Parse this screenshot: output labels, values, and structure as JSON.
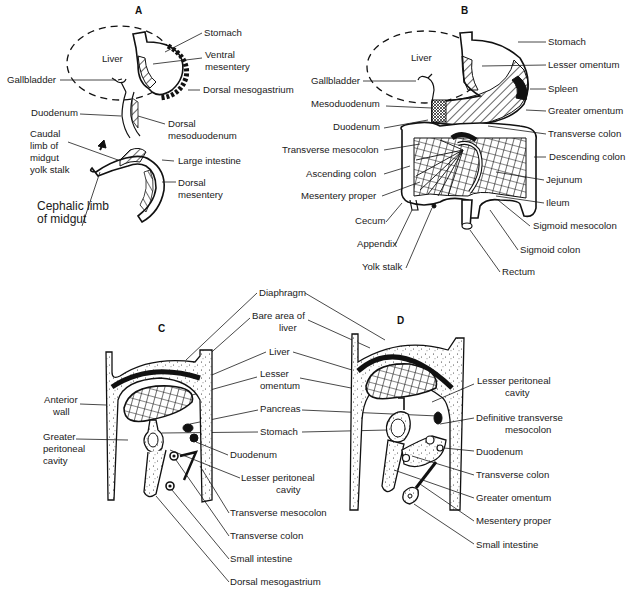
{
  "figure": {
    "panels": [
      {
        "id": "A",
        "label": "A",
        "labels": {
          "liver": "Liver",
          "stomach": "Stomach",
          "ventral_mesentery": "Ventral mesentery",
          "ventral_mesentery_l1": "Ventral",
          "ventral_mesentery_l2": "mesentery",
          "gallbladder": "Gallbladder",
          "dorsal_mesogastrium": "Dorsal mesogastrium",
          "duodenum": "Duodenum",
          "dorsal_mesoduodenum_l1": "Dorsal",
          "dorsal_mesoduodenum_l2": "mesoduodenum",
          "caudal_limb_l1": "Caudal",
          "caudal_limb_l2": "limb of",
          "caudal_limb_l3": "midgut",
          "caudal_limb_l4": "yolk stalk",
          "large_intestine": "Large intestine",
          "dorsal_mesentery_l1": "Dorsal",
          "dorsal_mesentery_l2": "mesentery",
          "cephalic_limb_l1": "Cephalic limb",
          "cephalic_limb_l2": "of midgut"
        }
      },
      {
        "id": "B",
        "label": "B",
        "labels": {
          "liver": "Liver",
          "stomach": "Stomach",
          "lesser_omentum": "Lesser omentum",
          "gallbladder": "Gallbladder",
          "spleen": "Spleen",
          "mesoduodenum": "Mesoduodenum",
          "greater_omentum": "Greater omentum",
          "duodenum": "Duodenum",
          "transverse_colon": "Transverse colon",
          "transverse_mesocolon": "Transverse mesocolon",
          "descending_colon": "Descending colon",
          "ascending_colon": "Ascending colon",
          "jejunum": "Jejunum",
          "mesentery_proper": "Mesentery proper",
          "ileum": "Ileum",
          "cecum": "Cecum",
          "sigmoid_mesocolon": "Sigmoid mesocolon",
          "appendix": "Appendix",
          "sigmoid_colon": "Sigmoid colon",
          "yolk_stalk": "Yolk stalk",
          "rectum": "Rectum"
        }
      },
      {
        "id": "C",
        "label": "C",
        "labels": {
          "anterior_wall_l1": "Anterior",
          "anterior_wall_l2": "wall",
          "greater_peritoneal_l1": "Greater",
          "greater_peritoneal_l2": "peritoneal",
          "greater_peritoneal_l3": "cavity",
          "duodenum": "Duodenum",
          "lesser_peritoneal_l1": "Lesser peritoneal",
          "lesser_peritoneal_l2": "cavity",
          "transverse_mesocolon": "Transverse mesocolon",
          "transverse_colon": "Transverse colon",
          "small_intestine": "Small intestine",
          "dorsal_mesogastrium": "Dorsal mesogastrium"
        }
      },
      {
        "id": "D",
        "label": "D",
        "labels": {
          "lesser_peritoneal_l1": "Lesser peritoneal",
          "lesser_peritoneal_l2": "cavity",
          "definitive_tm_l1": "Definitive transverse",
          "definitive_tm_l2": "mesocolon",
          "duodenum": "Duodenum",
          "transverse_colon": "Transverse colon",
          "greater_omentum": "Greater omentum",
          "mesentery_proper": "Mesentery proper",
          "small_intestine": "Small intestine"
        }
      }
    ],
    "shared_labels_cd": {
      "diaphragm": "Diaphragm",
      "bare_area_l1": "Bare area of",
      "bare_area_l2": "liver",
      "liver": "Liver",
      "lesser_omentum_l1": "Lesser",
      "lesser_omentum_l2": "omentum",
      "pancreas": "Pancreas",
      "stomach": "Stomach"
    },
    "colors": {
      "ink": "#1a1a1a",
      "background": "#ffffff"
    }
  }
}
